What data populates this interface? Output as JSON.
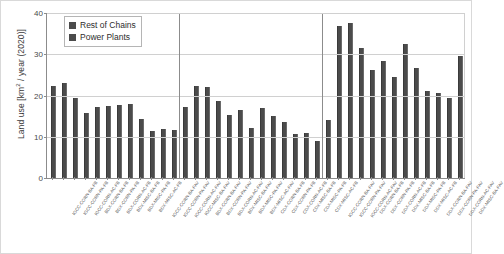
{
  "chart_data": {
    "type": "bar",
    "title": "",
    "xlabel": "",
    "ylabel": "Land use [km² / year (2020)]",
    "ylim": [
      0,
      40
    ],
    "yticks": [
      0,
      10,
      20,
      30,
      40
    ],
    "grid": true,
    "legend_position": "top-left",
    "legend": [
      {
        "name": "Rest of Chains",
        "color": "#4b4b4b"
      },
      {
        "name": "Power Plants",
        "color": "#4b4b4b"
      }
    ],
    "series": [
      {
        "name": "Rest of Chains",
        "values": [
          22.4,
          23.1,
          19.3,
          15.8,
          17.2,
          17.4,
          17.6,
          18.0,
          14.2,
          11.5,
          11.8,
          11.6,
          17.1,
          22.3,
          22.0,
          18.6,
          15.2,
          16.6,
          12.2,
          17.0,
          15.1,
          13.7,
          10.6,
          11.0,
          9.0,
          14.1,
          36.8,
          37.6,
          31.6,
          26.2,
          28.4,
          24.6,
          32.6,
          26.6,
          21.2,
          20.6,
          19.4,
          29.6
        ]
      },
      {
        "name": "Power Plants",
        "values": [
          0.5,
          0.5,
          0.4,
          0.4,
          0.4,
          0.4,
          0.4,
          0.4,
          0.4,
          0.3,
          0.3,
          0.3,
          0.4,
          0.5,
          0.5,
          0.4,
          0.4,
          0.4,
          0.3,
          0.4,
          0.4,
          0.3,
          0.3,
          0.3,
          0.3,
          0.4,
          0.6,
          0.6,
          0.6,
          0.5,
          0.5,
          0.5,
          0.6,
          0.5,
          0.4,
          0.4,
          0.4,
          0.5
        ]
      }
    ],
    "categories": [
      "IGCC-CORN-BA-FB",
      "IGCC-CORN-PA-FB",
      "IGCC-CORN-AC-FB",
      "BDX-CORN-BA-FB",
      "BDX-CORN-PA-FB",
      "BDX-CORN-AC-FB",
      "BDX-MISC-BA-FB",
      "BDX-MISC-PA-FB",
      "BDX-MISC-AC-FB",
      "IGCC-CORN-BA-FAV",
      "IGCC-CORN-PA-FAV",
      "IGCC-CORN-AC-FAV",
      "IGCC-MISC-BA-FAV",
      "BDX-CORN-BA-FAV",
      "BDX-CORN-PA-FAV",
      "BDX-CORN-AC-FAV",
      "BDX-MISC-BA-FAV",
      "BDX-MISC-PA-FAV",
      "BDX-MISC-AC-FAV",
      "CDX-CORN-BA-FB",
      "CDX-CORN-PA-FB",
      "CDX-CORN-AC-FB",
      "CDX-MISC-BA-FB",
      "CDX-MISC-PA-FB",
      "CDX-MISC-AC-FB",
      "IGCC-CORN-BA-FAV",
      "IGCC-CORN-PA-FAV",
      "IGCC-CORN-AC-FAV",
      "DDX-CORN-BA-FB",
      "DDX-CORN-PA-FB",
      "DDX-CORN-AC-FB",
      "DDX-MISC-BA-FB",
      "DDX-MISC-PA-FB",
      "DDX-MISC-AC-FB",
      "DDX-CORN-BA-FAV",
      "DDX-CORN-PA-FAV",
      "DDX-CORN-AC-FAV",
      "DDX-MISC-BA-FAV"
    ],
    "group_separators_after_index": [
      12,
      25
    ],
    "bar_color": "#4b4b4b"
  }
}
